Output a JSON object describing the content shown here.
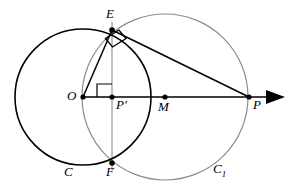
{
  "figure": {
    "background_color": "#ffffff",
    "width": 292,
    "height": 192
  },
  "style": {
    "circle_c_color": "#000000",
    "circle_c1_color": "#8c8c8c",
    "line_color": "#000000",
    "chord_color": "#7a7a7a",
    "point_color": "#000000",
    "label_color": "#000000"
  },
  "labels": {
    "O": "O",
    "P_prime": "P′",
    "M": "M",
    "P": "P",
    "E": "E",
    "F": "F",
    "C": "C",
    "C1_base": "C",
    "C1_sub": "1"
  },
  "geometry": {
    "points": [
      {
        "name": "O",
        "x": 83,
        "y": 97,
        "label": "O",
        "label_x": 67,
        "label_y": 91,
        "dot": true
      },
      {
        "name": "P_prime",
        "x": 112,
        "y": 97,
        "label": "P′",
        "label_x": 116,
        "label_y": 99,
        "dot": true
      },
      {
        "name": "M",
        "x": 165,
        "y": 97,
        "label": "M",
        "label_x": 159,
        "label_y": 101,
        "dot": true
      },
      {
        "name": "P",
        "x": 249,
        "y": 97,
        "label": "P",
        "label_x": 252,
        "label_y": 99,
        "dot": true
      },
      {
        "name": "E",
        "x": 112,
        "y": 30,
        "label": "E",
        "label_x": 107,
        "label_y": 7,
        "dot": true
      },
      {
        "name": "F",
        "x": 112,
        "y": 163,
        "label": "F",
        "label_x": 107,
        "label_y": 166,
        "dot": true
      }
    ],
    "circles": [
      {
        "name": "C",
        "cx": 83,
        "cy": 97,
        "r": 68,
        "color": "#000000",
        "stroke_width": 1.6,
        "label": "C",
        "label_x": 66,
        "label_y": 166
      },
      {
        "name": "C1",
        "cx": 165,
        "cy": 97,
        "r": 83,
        "color": "#8c8c8c",
        "stroke_width": 1.2,
        "label": "C1",
        "label_x": 215,
        "label_y": 163
      }
    ],
    "segments": [
      {
        "name": "OE",
        "x1": 83,
        "y1": 97,
        "x2": 112,
        "y2": 30,
        "color": "#000000",
        "stroke_width": 1.5
      },
      {
        "name": "EP",
        "x1": 112,
        "y1": 30,
        "x2": 249,
        "y2": 97,
        "color": "#000000",
        "stroke_width": 1.5
      },
      {
        "name": "EF-chord",
        "x1": 112,
        "y1": 22,
        "x2": 112,
        "y2": 170,
        "color": "#8c8c8c",
        "stroke_width": 1.1
      },
      {
        "name": "OP-axis",
        "x1": 83,
        "y1": 97,
        "x2": 268,
        "y2": 97,
        "color": "#000000",
        "stroke_width": 1.6
      }
    ],
    "arrow": {
      "name": "axis-arrowhead",
      "tip_x": 285,
      "tip_y": 97,
      "back_x": 266,
      "half_height": 7
    },
    "right_angles": [
      {
        "name": "right-angle-at-P-prime",
        "path": "M 97 97 L 97 84 L 112 84",
        "color": "#000000"
      },
      {
        "name": "right-angle-at-E",
        "path": "M 104 37 L 110 46 L 124 37 L 118 29 Z",
        "color": "#000000"
      }
    ],
    "axis_ray_label": "OP"
  }
}
